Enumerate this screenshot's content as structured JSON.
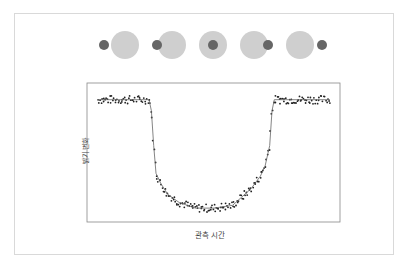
{
  "diagram": {
    "title": "",
    "phases": [
      {
        "label": "before-transit",
        "star_x": 125,
        "planet_x": 104
      },
      {
        "label": "ingress",
        "star_x": 172,
        "planet_x": 157
      },
      {
        "label": "mid-transit",
        "star_x": 213,
        "planet_x": 213
      },
      {
        "label": "egress",
        "star_x": 254,
        "planet_x": 268
      },
      {
        "label": "after-transit",
        "star_x": 300,
        "planet_x": 322
      }
    ],
    "colors": {
      "star": "#cfcfcf",
      "planet": "#666666",
      "points": "#222222",
      "curve": "#666666",
      "axis": "#888888",
      "frame": "#d9d9d9"
    }
  },
  "chart_data": {
    "type": "scatter",
    "title": "",
    "xlabel": "관측 시간",
    "ylabel": "밝기 변화",
    "grid": false,
    "legend": null,
    "x_ticks": [],
    "y_ticks": [],
    "xlim": [
      0,
      100
    ],
    "ylim": [
      0,
      1
    ],
    "series": [
      {
        "name": "model-curve",
        "kind": "line",
        "x": [
          0,
          22,
          23,
          24,
          25,
          27,
          30,
          35,
          42,
          50,
          58,
          62,
          66,
          70,
          72,
          74,
          75,
          76,
          100
        ],
        "y": [
          0.88,
          0.88,
          0.8,
          0.55,
          0.35,
          0.28,
          0.2,
          0.14,
          0.1,
          0.1,
          0.12,
          0.18,
          0.24,
          0.33,
          0.4,
          0.55,
          0.8,
          0.88,
          0.88
        ]
      },
      {
        "name": "observations",
        "kind": "scatter",
        "description": "noisy photometric data points scattered around the model curve",
        "x_range": [
          0,
          100
        ],
        "count_approx": 220,
        "noise": 0.02
      }
    ]
  }
}
